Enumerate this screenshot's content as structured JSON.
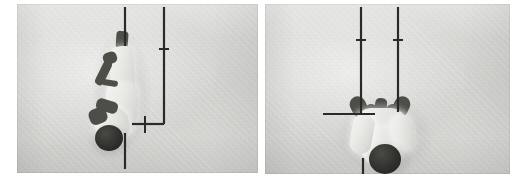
{
  "figure": {
    "type": "photo-pair",
    "panel_count": 2,
    "background_color": "#ffffff",
    "ink_color": "#2a2a28",
    "photo_tone": "#d8d8d6",
    "caption": ""
  },
  "panels": [
    {
      "id": "panel-left",
      "name": "left-photograph",
      "alt": "Overhead grayscale photograph of a person in white clothing lying along a vertical axis, photographed from above, with hand-drawn measurement lines overlaid",
      "x": 17,
      "y": 4,
      "width": 241,
      "height": 169,
      "subject": {
        "description": "person in white uniform viewed from above, dark head at lower end, dark arm/implement across the torso",
        "orientation": "head-down",
        "tone_light": "#efefec",
        "tone_dark": "#2e2e2b"
      },
      "overlay": {
        "name": "measurement-lines-left",
        "elements": [
          {
            "name": "vertical-reference-line-a",
            "kind": "line",
            "x1": 108,
            "y1": 3,
            "x2": 108,
            "y2": 42
          },
          {
            "name": "vertical-reference-line-b",
            "kind": "line",
            "x1": 147,
            "y1": 3,
            "x2": 147,
            "y2": 120
          },
          {
            "name": "tick-on-line-b",
            "kind": "tick",
            "x1": 142,
            "y1": 45,
            "x2": 152,
            "y2": 45
          },
          {
            "name": "corner-bend-horizontal",
            "kind": "line",
            "x1": 115,
            "y1": 120,
            "x2": 147,
            "y2": 120
          },
          {
            "name": "cross-tick-vertical",
            "kind": "tick",
            "x1": 128,
            "y1": 112,
            "x2": 128,
            "y2": 129
          },
          {
            "name": "vertical-reference-line-c",
            "kind": "line",
            "x1": 108,
            "y1": 129,
            "x2": 108,
            "y2": 165
          }
        ]
      }
    },
    {
      "id": "panel-right",
      "name": "right-photograph",
      "alt": "Overhead grayscale photograph of the same person seen end-on from above with arms spread, dark head at the bottom, with hand-drawn measurement lines overlaid",
      "x": 265,
      "y": 4,
      "width": 245,
      "height": 170,
      "subject": {
        "description": "person in white uniform seen end-on from above, dark head/helmet at bottom, dark gloved hands spread either side",
        "orientation": "head-down",
        "tone_light": "#efefec",
        "tone_dark": "#2b2b28"
      },
      "overlay": {
        "name": "measurement-lines-right",
        "elements": [
          {
            "name": "vertical-reference-line-a",
            "kind": "line",
            "x1": 96,
            "y1": 3,
            "x2": 96,
            "y2": 110
          },
          {
            "name": "tick-on-line-a",
            "kind": "tick",
            "x1": 91,
            "y1": 36,
            "x2": 101,
            "y2": 36
          },
          {
            "name": "vertical-reference-line-b",
            "kind": "line",
            "x1": 133,
            "y1": 3,
            "x2": 133,
            "y2": 108
          },
          {
            "name": "tick-on-line-b",
            "kind": "tick",
            "x1": 128,
            "y1": 36,
            "x2": 138,
            "y2": 36
          },
          {
            "name": "horizontal-baseline",
            "kind": "line",
            "x1": 58,
            "y1": 110,
            "x2": 110,
            "y2": 110
          },
          {
            "name": "vertical-reference-line-c",
            "kind": "line",
            "x1": 98,
            "y1": 154,
            "x2": 98,
            "y2": 174
          }
        ]
      }
    }
  ]
}
